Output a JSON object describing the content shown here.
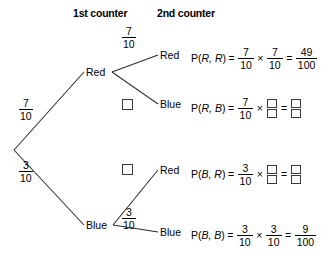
{
  "headers": {
    "stage1": "1st counter",
    "stage2": "2nd counter"
  },
  "colors": {
    "line": "#2b2b2b",
    "text": "#000000",
    "box_border": "#3a3a3a",
    "background": "#ffffff"
  },
  "tree": {
    "root_branches": [
      {
        "label": "Red",
        "prob_num": "7",
        "prob_den": "10"
      },
      {
        "label": "Blue",
        "prob_num": "3",
        "prob_den": "10"
      }
    ],
    "second_stage": [
      {
        "from": "Red",
        "label": "Red",
        "prob_num": "7",
        "prob_den": "10",
        "blank": false
      },
      {
        "from": "Red",
        "label": "Blue",
        "prob_num": "",
        "prob_den": "",
        "blank": true
      },
      {
        "from": "Blue",
        "label": "Red",
        "prob_num": "",
        "prob_den": "",
        "blank": true
      },
      {
        "from": "Blue",
        "label": "Blue",
        "prob_num": "3",
        "prob_den": "10",
        "blank": false
      }
    ]
  },
  "equations": [
    {
      "outcome": "Red",
      "prob_open": "P(",
      "prob_args": "R, R",
      "prob_close": ")",
      "equals": "=",
      "times": "×",
      "f1_num": "7",
      "f1_den": "10",
      "f2_num": "7",
      "f2_den": "10",
      "result_num": "49",
      "result_den": "100",
      "f2_blank": false,
      "result_blank": false
    },
    {
      "outcome": "Blue",
      "prob_open": "P(",
      "prob_args": "R, B",
      "prob_close": ")",
      "equals": "=",
      "times": "×",
      "f1_num": "7",
      "f1_den": "10",
      "f2_num": "",
      "f2_den": "",
      "result_num": "",
      "result_den": "",
      "f2_blank": true,
      "result_blank": true
    },
    {
      "outcome": "Red",
      "prob_open": "P(",
      "prob_args": "B, R",
      "prob_close": ")",
      "equals": "=",
      "times": "×",
      "f1_num": "3",
      "f1_den": "10",
      "f2_num": "",
      "f2_den": "",
      "result_num": "",
      "result_den": "",
      "f2_blank": true,
      "result_blank": true
    },
    {
      "outcome": "Blue",
      "prob_open": "P(",
      "prob_args": "B, B",
      "prob_close": ")",
      "equals": "=",
      "times": "×",
      "f1_num": "3",
      "f1_den": "10",
      "f2_num": "3",
      "f2_den": "10",
      "result_num": "9",
      "result_den": "100",
      "f2_blank": false,
      "result_blank": false
    }
  ]
}
